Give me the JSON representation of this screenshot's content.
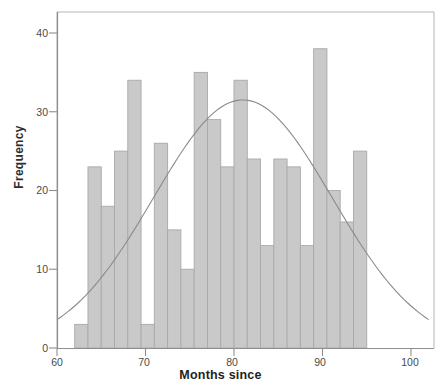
{
  "chart_data": {
    "type": "bar",
    "title": "",
    "xlabel": "Months since",
    "ylabel": "Frequency",
    "xlim": [
      60,
      102
    ],
    "ylim": [
      0,
      42
    ],
    "xticks": [
      60,
      70,
      80,
      90,
      100
    ],
    "yticks": [
      0,
      10,
      20,
      30,
      40
    ],
    "grid": false,
    "legend": "none",
    "bin_width": 1.5,
    "bin_starts": [
      62,
      63.5,
      65,
      66.5,
      68,
      69.5,
      71,
      72.5,
      74,
      75.5,
      77,
      78.5,
      80,
      81.5,
      83,
      84.5,
      86,
      87.5,
      89,
      90.5,
      92,
      93.5,
      95,
      96.5
    ],
    "categories": [
      "62-63.5",
      "63.5-65",
      "65-66.5",
      "66.5-68",
      "68-69.5",
      "69.5-71",
      "71-72.5",
      "72.5-74",
      "74-75.5",
      "75.5-77",
      "77-78.5",
      "78.5-80",
      "80-81.5",
      "81.5-83",
      "83-84.5",
      "84.5-86",
      "86-87.5",
      "87.5-89",
      "89-90.5",
      "90.5-92",
      "92-93.5",
      "93.5-95",
      "95-96.5",
      "96.5-98"
    ],
    "values": [
      3,
      23,
      18,
      25,
      34,
      3,
      26,
      15,
      10,
      35,
      29,
      23,
      34,
      24,
      13,
      24,
      23,
      13,
      38,
      20,
      16,
      25,
      0,
      0
    ],
    "overlay": {
      "name": "normal-curve",
      "type": "line",
      "mean": 81,
      "peak_value": 31.5,
      "start_value": 3.6,
      "end_value": 3.7,
      "color": "#8a8a8a"
    },
    "colors": {
      "bar_fill": "#c9c9c9",
      "bar_stroke": "#a9a9a9",
      "axis": "#8f8f8f",
      "curve": "#8a8a8a",
      "text": "#333333"
    }
  },
  "axes": {
    "y_label": "Frequency",
    "x_label": "Months since",
    "y_tick_labels": [
      "0",
      "10",
      "20",
      "30",
      "40"
    ],
    "x_tick_labels": [
      "60",
      "70",
      "80",
      "90",
      "100"
    ]
  },
  "title_fragment": ""
}
